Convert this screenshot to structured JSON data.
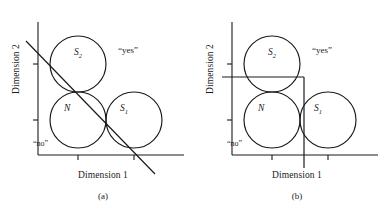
{
  "figure": {
    "panels": [
      {
        "id": "a",
        "caption": "(a)",
        "axis_x_label": "Dimension 1",
        "axis_y_label": "Dimension 2",
        "region_positive": "“yes”",
        "region_negative": "“no”",
        "boundary_type": "linear-diagonal",
        "sets": [
          {
            "name": "S",
            "subscript": "2",
            "role": "upper-left-circle"
          },
          {
            "name": "N",
            "subscript": "",
            "role": "lower-left-circle"
          },
          {
            "name": "S",
            "subscript": "1",
            "role": "lower-right-circle"
          }
        ]
      },
      {
        "id": "b",
        "caption": "(b)",
        "axis_x_label": "Dimension 1",
        "axis_y_label": "Dimension 2",
        "region_positive": "“yes”",
        "region_negative": "“no”",
        "boundary_type": "axis-parallel-step",
        "sets": [
          {
            "name": "S",
            "subscript": "2",
            "role": "upper-left-circle"
          },
          {
            "name": "N",
            "subscript": "",
            "role": "lower-left-circle"
          },
          {
            "name": "S",
            "subscript": "1",
            "role": "lower-right-circle"
          }
        ]
      }
    ],
    "colors": {
      "stroke": "#1a1a1a",
      "background": "#ffffff"
    }
  }
}
